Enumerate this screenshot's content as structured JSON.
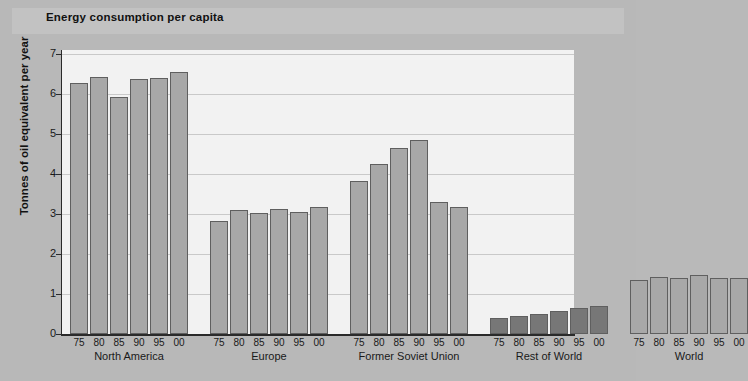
{
  "chart_data": {
    "type": "bar",
    "title": "Energy consumption per capita",
    "xlabel": "",
    "ylabel": "Tonnes of oil equivalent per year",
    "ylim": [
      0,
      7
    ],
    "yticks": [
      0,
      1,
      2,
      3,
      4,
      5,
      6,
      7
    ],
    "ytick_labels": [
      "0",
      "1",
      "2",
      "3",
      "4",
      "5",
      "6",
      "7"
    ],
    "grid": true,
    "legend": "none",
    "categories": [
      "75",
      "80",
      "85",
      "90",
      "95",
      "00"
    ],
    "groups": [
      {
        "name": "North America",
        "color": "#a8a8a8",
        "values": [
          6.28,
          6.43,
          5.92,
          6.38,
          6.4,
          6.55
        ]
      },
      {
        "name": "Europe",
        "color": "#a8a8a8",
        "values": [
          2.83,
          3.1,
          3.03,
          3.13,
          3.05,
          3.18
        ]
      },
      {
        "name": "Former Soviet Union",
        "color": "#a8a8a8",
        "values": [
          3.83,
          4.25,
          4.65,
          4.85,
          3.3,
          3.18
        ]
      },
      {
        "name": "Rest of World",
        "color": "#777777",
        "values": [
          0.4,
          0.45,
          0.5,
          0.57,
          0.65,
          0.7
        ]
      },
      {
        "name": "World",
        "color": "#a8a8a8",
        "values": [
          1.35,
          1.43,
          1.4,
          1.47,
          1.4,
          1.41
        ]
      }
    ]
  }
}
